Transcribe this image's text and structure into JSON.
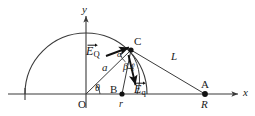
{
  "figure": {
    "type": "physics-vector-diagram",
    "axes": {
      "x_label": "x",
      "y_label": "y",
      "origin_label": "O"
    },
    "points": [
      {
        "id": "O",
        "label": "O",
        "x": 86,
        "y": 94
      },
      {
        "id": "B",
        "label": "B",
        "x": 122,
        "y": 94
      },
      {
        "id": "C",
        "label": "C",
        "x": 131,
        "y": 50
      },
      {
        "id": "A",
        "label": "A",
        "x": 205,
        "y": 94
      }
    ],
    "segment_labels": {
      "radius_a": "a",
      "small_radius_l": "ℓ",
      "distance_r": "r",
      "distance_R": "R",
      "distance_L": "L"
    },
    "angle_labels": {
      "theta": "θ",
      "alpha": "α",
      "beta": "β"
    },
    "vectors": [
      {
        "id": "E_Q",
        "symbol": "E",
        "subscript": "Q",
        "label": "E_Q"
      },
      {
        "id": "E_q",
        "symbol": "E",
        "subscript": "q",
        "label": "E_q"
      }
    ],
    "colors": {
      "stroke": "#3a3a3a",
      "text": "#1a1a1a",
      "vector": "#111111",
      "background": "#ffffff"
    }
  }
}
